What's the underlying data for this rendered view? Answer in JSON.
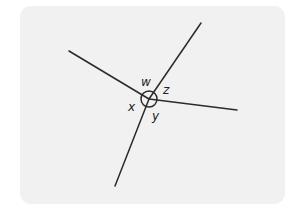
{
  "diagram": {
    "type": "intersecting-lines-angles",
    "background_color": "#f1f1f1",
    "line_color": "#2a2a2a",
    "center": {
      "x": 149,
      "y": 99
    },
    "angle_circle_radius": 8,
    "rays": [
      {
        "name": "ray-upper-left",
        "end": {
          "x": 69,
          "y": 51
        }
      },
      {
        "name": "ray-upper-right",
        "end": {
          "x": 201,
          "y": 23
        }
      },
      {
        "name": "ray-right",
        "end": {
          "x": 237,
          "y": 110
        }
      },
      {
        "name": "ray-lower-left",
        "end": {
          "x": 115,
          "y": 186
        }
      }
    ],
    "angle_labels": [
      {
        "label": "w",
        "x": 141,
        "y": 86
      },
      {
        "label": "z",
        "x": 163,
        "y": 94
      },
      {
        "label": "x",
        "x": 128,
        "y": 111
      },
      {
        "label": "y",
        "x": 152,
        "y": 120
      }
    ]
  }
}
